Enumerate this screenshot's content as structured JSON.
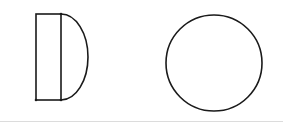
{
  "diagram": {
    "colors": {
      "stroke": "#1a1a1a",
      "background": "#ffffff",
      "rule": "#dcdcdc"
    },
    "shapes": [
      {
        "id": "rectangle",
        "type": "rect",
        "x": 36,
        "y": 14,
        "width": 25,
        "height": 86
      },
      {
        "id": "semicircle",
        "type": "semicircle",
        "chord_x": 61,
        "y_top": 14,
        "y_bottom": 100,
        "bulge_x": 88
      },
      {
        "id": "circle",
        "type": "circle",
        "cx": 214,
        "cy": 63,
        "r": 48
      }
    ]
  }
}
